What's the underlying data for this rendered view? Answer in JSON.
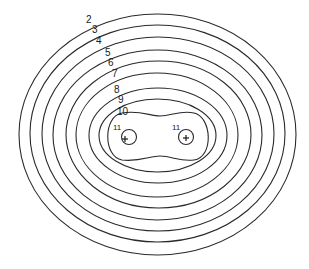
{
  "diagram": {
    "type": "contour-map",
    "line_color": "#2a2a2a",
    "background": "#ffffff",
    "contours": [
      {
        "level": "2",
        "label": "2",
        "cx": 157.5,
        "cy": 134.5,
        "rx": 138.5,
        "ry": 120.5,
        "label_x": 86,
        "label_y": 23
      },
      {
        "level": "3",
        "label": "3",
        "cx": 157.5,
        "cy": 133.5,
        "rx": 127.5,
        "ry": 108.5,
        "label_x": 92,
        "label_y": 33
      },
      {
        "level": "4",
        "label": "4",
        "cx": 158,
        "cy": 134,
        "rx": 116,
        "ry": 97,
        "label_x": 96,
        "label_y": 44
      },
      {
        "level": "5",
        "label": "5",
        "cx": 157.5,
        "cy": 135,
        "rx": 104.5,
        "ry": 85,
        "label_x": 105,
        "label_y": 56
      },
      {
        "level": "6",
        "label": "6",
        "cx": 158.5,
        "cy": 134.5,
        "rx": 92.5,
        "ry": 73.5,
        "label_x": 108,
        "label_y": 66
      },
      {
        "level": "7",
        "label": "7",
        "cx": 157,
        "cy": 135,
        "rx": 81,
        "ry": 62,
        "label_x": 112,
        "label_y": 77
      },
      {
        "level": "8",
        "label": "8",
        "cx": 158,
        "cy": 135.5,
        "rx": 69,
        "ry": 47.5,
        "label_x": 114,
        "label_y": 93
      },
      {
        "level": "9",
        "label": "9",
        "cx": 157.5,
        "cy": 135.5,
        "rx": 58.5,
        "ry": 36.5,
        "label_x": 118,
        "label_y": 103
      },
      {
        "level": "10",
        "label": "10",
        "shape": "peanut",
        "label_x": 117,
        "label_y": 115
      }
    ],
    "sources": [
      {
        "label": "11",
        "symbol": "+",
        "cx": 129,
        "cy": 137,
        "r": 7.5,
        "label_x": 113,
        "label_y": 130,
        "plus_x": 125,
        "plus_y": 139
      },
      {
        "label": "11",
        "symbol": "+",
        "cx": 186,
        "cy": 137,
        "r": 7.5,
        "label_x": 172,
        "label_y": 130,
        "plus_x": 186,
        "plus_y": 138
      }
    ]
  }
}
